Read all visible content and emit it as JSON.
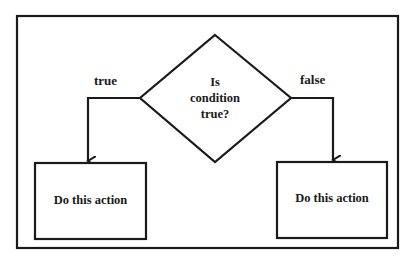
{
  "diagram": {
    "type": "flowchart-decision",
    "decision": {
      "lines": [
        "Is",
        "condition",
        "true?"
      ]
    },
    "branches": {
      "true": {
        "label": "true",
        "action": "Do this action"
      },
      "false": {
        "label": "false",
        "action": "Do this action"
      }
    },
    "colors": {
      "stroke": "#1a1a1a",
      "background": "#ffffff"
    }
  }
}
